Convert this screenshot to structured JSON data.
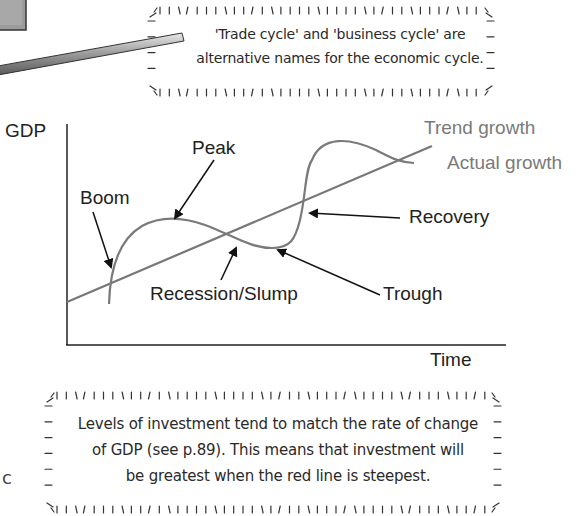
{
  "top_note": {
    "lines": [
      "'Trade cycle' and 'business cycle' are",
      "alternative names for the economic cycle."
    ]
  },
  "chart": {
    "y_axis_label": "GDP",
    "x_axis_label": "Time",
    "legend": {
      "trend": "Trend growth",
      "actual": "Actual growth"
    },
    "annotations": {
      "peak": "Peak",
      "boom": "Boom",
      "recovery": "Recovery",
      "recession": "Recession/Slump",
      "trough": "Trough"
    }
  },
  "bottom_note": {
    "lines": [
      "Levels of investment tend to match the rate of change",
      "of GDP (see p.89).  This means that investment will",
      "be greatest when the red line is steepest."
    ]
  },
  "edge_text": "c",
  "colors": {
    "curve": "#7a7a7a",
    "axis": "#222222",
    "arrow": "#111111",
    "note_text": "#2a2a2a"
  },
  "chart_data": {
    "type": "line",
    "title": "",
    "xlabel": "Time",
    "ylabel": "GDP",
    "grid": false,
    "series": [
      {
        "name": "Trend growth",
        "shape": "straight rising line"
      },
      {
        "name": "Actual growth",
        "shape": "oscillating wave around trend: boom, peak, recession/slump, trough, recovery"
      }
    ],
    "annotations": [
      "Boom",
      "Peak",
      "Recession/Slump",
      "Trough",
      "Recovery"
    ]
  }
}
